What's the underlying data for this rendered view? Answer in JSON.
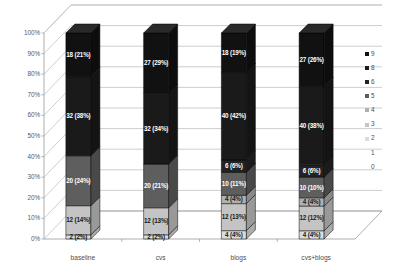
{
  "chart_data": {
    "type": "bar",
    "title": "",
    "subtitle": "",
    "xlabel": "",
    "ylabel": "",
    "stacked": true,
    "normalized": "100%",
    "grid": true,
    "legend_position": "right",
    "ylim": [
      0,
      100
    ],
    "yticks": [
      "0%",
      "10%",
      "20%",
      "30%",
      "40%",
      "50%",
      "60%",
      "70%",
      "80%",
      "90%",
      "100%"
    ],
    "categories": [
      "baseline",
      "cvs",
      "blogs",
      "cvs+blogs"
    ],
    "legend": [
      "9",
      "8",
      "6",
      "5",
      "4",
      "3",
      "2",
      "1",
      "0"
    ],
    "series": [
      {
        "name": "0",
        "color": "#ffffff",
        "values": [
          0,
          0,
          0,
          0
        ],
        "labels": [
          "",
          "",
          "",
          ""
        ]
      },
      {
        "name": "1",
        "color": "#f2f2f2",
        "values": [
          0,
          0,
          0,
          0
        ],
        "labels": [
          "",
          "",
          "",
          ""
        ]
      },
      {
        "name": "2",
        "color": "#dcdcdc",
        "values": [
          2,
          2,
          4,
          4
        ],
        "percents": [
          2,
          2,
          4,
          4
        ],
        "labels": [
          "2 (2%)",
          "2 (2%)",
          "4 (4%)",
          "4 (4%)"
        ]
      },
      {
        "name": "3",
        "color": "#c4c4c4",
        "values": [
          12,
          12,
          12,
          12
        ],
        "percents": [
          14,
          13,
          13,
          12
        ],
        "labels": [
          "12 (14%)",
          "12 (13%)",
          "12 (13%)",
          "12 (12%)"
        ]
      },
      {
        "name": "4",
        "color": "#b0b0b0",
        "values": [
          0,
          0,
          4,
          4
        ],
        "percents": [
          0,
          0,
          4,
          4
        ],
        "labels": [
          "",
          "",
          "4 (4%)",
          "4 (4%)"
        ]
      },
      {
        "name": "5",
        "color": "#5e5e5e",
        "values": [
          20,
          20,
          10,
          10
        ],
        "percents": [
          24,
          21,
          11,
          10
        ],
        "labels": [
          "20 (24%)",
          "20 (21%)",
          "10 (11%)",
          "10 (10%)"
        ]
      },
      {
        "name": "6",
        "color": "#232323",
        "values": [
          0,
          0,
          6,
          6
        ],
        "percents": [
          0,
          0,
          6,
          6
        ],
        "labels": [
          "",
          "",
          "6 (6%)",
          "6 (6%)"
        ]
      },
      {
        "name": "8",
        "color": "#1a1a1a",
        "values": [
          32,
          32,
          40,
          40
        ],
        "percents": [
          38,
          34,
          42,
          38
        ],
        "labels": [
          "32 (38%)",
          "32 (34%)",
          "40 (42%)",
          "40 (38%)"
        ]
      },
      {
        "name": "9",
        "color": "#111111",
        "values": [
          18,
          27,
          18,
          27
        ],
        "percents": [
          21,
          29,
          19,
          26
        ],
        "labels": [
          "18 (21%)",
          "27 (29%)",
          "18 (19%)",
          "27 (26%)"
        ]
      }
    ]
  },
  "colors": {
    "grid": "#b9b9b9",
    "axis": "#9a9a9a",
    "wall": "#ffffff",
    "floor": "#ffffff",
    "label_light": "#ffffff",
    "label_dark": "#1a1a1a",
    "tick_text": "#5a5a5a"
  }
}
